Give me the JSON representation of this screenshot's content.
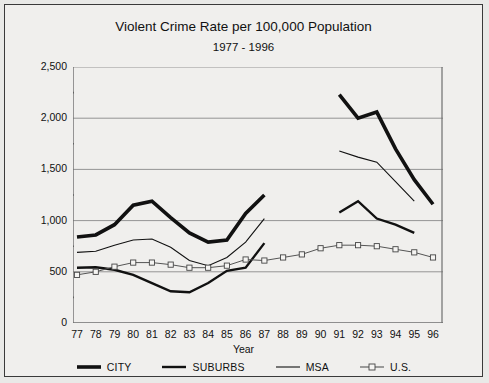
{
  "chart_data": {
    "type": "line",
    "title": "Violent Crime Rate per 100,000 Population",
    "subtitle": "1977 - 1996",
    "xlabel": "Year",
    "ylabel": "",
    "xlim": [
      77,
      96
    ],
    "ylim": [
      0,
      2500
    ],
    "grid": true,
    "legend_position": "bottom",
    "y_ticks": [
      0,
      500,
      1000,
      1500,
      2000,
      2500
    ],
    "y_tick_labels": [
      "0",
      "500",
      "1,000",
      "1,500",
      "2,000",
      "2,500"
    ],
    "y_minor_step": 250,
    "categories": [
      77,
      78,
      79,
      80,
      81,
      82,
      83,
      84,
      85,
      86,
      87,
      88,
      89,
      90,
      91,
      92,
      93,
      94,
      95,
      96
    ],
    "x_tick_labels": [
      "77",
      "78",
      "79",
      "80",
      "81",
      "82",
      "83",
      "84",
      "85",
      "86",
      "87",
      "88",
      "89",
      "90",
      "91",
      "92",
      "93",
      "94",
      "95",
      "96"
    ],
    "series": [
      {
        "name": "CITY",
        "style": "thick-solid",
        "color": "#111111",
        "width": 3.6,
        "marker": "none",
        "x": [
          77,
          78,
          79,
          80,
          81,
          82,
          83,
          84,
          85,
          86,
          87
        ],
        "values": [
          840,
          860,
          960,
          1150,
          1190,
          1030,
          880,
          790,
          810,
          1070,
          1250
        ]
      },
      {
        "name": "CITY",
        "style": "thick-solid",
        "color": "#111111",
        "width": 3.6,
        "marker": "none",
        "x": [
          91,
          92,
          93,
          94,
          95,
          96
        ],
        "values": [
          2230,
          2000,
          2060,
          1700,
          1400,
          1160
        ]
      },
      {
        "name": "SUBURBS",
        "style": "medium-solid",
        "color": "#111111",
        "width": 2.4,
        "marker": "none",
        "x": [
          77,
          78,
          79,
          80,
          81,
          82,
          83,
          84,
          85,
          86,
          87
        ],
        "values": [
          540,
          545,
          520,
          470,
          390,
          310,
          300,
          390,
          510,
          540,
          780
        ]
      },
      {
        "name": "SUBURBS",
        "style": "medium-solid",
        "color": "#111111",
        "width": 2.4,
        "marker": "none",
        "x": [
          91,
          92,
          93,
          94,
          95
        ],
        "values": [
          1080,
          1190,
          1020,
          960,
          880
        ]
      },
      {
        "name": "MSA",
        "style": "thin-solid",
        "color": "#111111",
        "width": 1.1,
        "marker": "none",
        "x": [
          77,
          78,
          79,
          80,
          81,
          82,
          83,
          84,
          85,
          86,
          87
        ],
        "values": [
          690,
          700,
          760,
          810,
          820,
          740,
          610,
          560,
          640,
          790,
          1020
        ]
      },
      {
        "name": "MSA",
        "style": "thin-solid",
        "color": "#111111",
        "width": 1.1,
        "marker": "none",
        "x": [
          91,
          92,
          93,
          94,
          95
        ],
        "values": [
          1680,
          1620,
          1570,
          1380,
          1190
        ]
      },
      {
        "name": "U.S.",
        "style": "thin-solid-square-marker",
        "color": "#555555",
        "width": 1.0,
        "marker": "square",
        "x": [
          77,
          78,
          79,
          80,
          81,
          82,
          83,
          84,
          85,
          86,
          87,
          88,
          89,
          90,
          91,
          92,
          93,
          94,
          95,
          96
        ],
        "values": [
          470,
          500,
          550,
          590,
          590,
          570,
          540,
          540,
          560,
          620,
          610,
          640,
          670,
          730,
          760,
          760,
          750,
          720,
          690,
          640
        ]
      }
    ],
    "legend": [
      {
        "label": "CITY",
        "style": "thick-solid"
      },
      {
        "label": "SUBURBS",
        "style": "medium-solid"
      },
      {
        "label": "MSA",
        "style": "thin-solid"
      },
      {
        "label": "U.S.",
        "style": "thin-solid-square-marker"
      }
    ]
  }
}
